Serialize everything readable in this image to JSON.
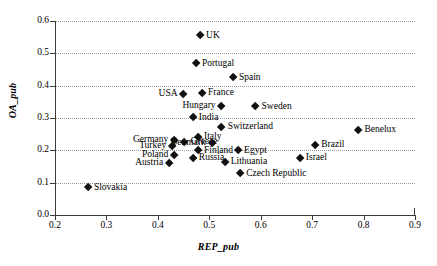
{
  "chart_data": {
    "type": "scatter",
    "title": "",
    "xlabel": "REP_pub",
    "ylabel": "OA_pub",
    "xlim": [
      0.2,
      0.9
    ],
    "ylim": [
      0.0,
      0.6
    ],
    "xticks": [
      "0.2",
      "0.3",
      "0.4",
      "0.5",
      "0.6",
      "0.7",
      "0.8",
      "0.9"
    ],
    "yticks": [
      "0.0",
      "0.1",
      "0.2",
      "0.3",
      "0.4",
      "0.5",
      "0.6"
    ],
    "grid": "horizontal-dotted",
    "legend": "none",
    "marker": "filled-diamond",
    "marker_color": "#111111",
    "points": [
      {
        "label": "UK",
        "x": 0.482,
        "y": 0.555,
        "label_side": "right"
      },
      {
        "label": "Portugal",
        "x": 0.474,
        "y": 0.468,
        "label_side": "right"
      },
      {
        "label": "Spain",
        "x": 0.546,
        "y": 0.425,
        "label_side": "right"
      },
      {
        "label": "France",
        "x": 0.486,
        "y": 0.377,
        "label_side": "right"
      },
      {
        "label": "USA",
        "x": 0.45,
        "y": 0.375,
        "label_side": "left"
      },
      {
        "label": "Hungary",
        "x": 0.524,
        "y": 0.337,
        "label_side": "left"
      },
      {
        "label": "Sweden",
        "x": 0.59,
        "y": 0.335,
        "label_side": "right"
      },
      {
        "label": "India",
        "x": 0.468,
        "y": 0.301,
        "label_side": "right"
      },
      {
        "label": "Switzerland",
        "x": 0.524,
        "y": 0.271,
        "label_side": "right"
      },
      {
        "label": "Benelux",
        "x": 0.79,
        "y": 0.262,
        "label_side": "right"
      },
      {
        "label": "Italy",
        "x": 0.478,
        "y": 0.241,
        "label_side": "right"
      },
      {
        "label": "Germany",
        "x": 0.432,
        "y": 0.232,
        "label_side": "left"
      },
      {
        "label": "Denmark",
        "x": 0.505,
        "y": 0.222,
        "label_side": "left"
      },
      {
        "label": "Greece",
        "x": 0.452,
        "y": 0.226,
        "label_side": "right"
      },
      {
        "label": "Turkey",
        "x": 0.428,
        "y": 0.214,
        "label_side": "left"
      },
      {
        "label": "Brazil",
        "x": 0.706,
        "y": 0.216,
        "label_side": "right"
      },
      {
        "label": "Finland",
        "x": 0.478,
        "y": 0.199,
        "label_side": "right"
      },
      {
        "label": "Egypt",
        "x": 0.556,
        "y": 0.199,
        "label_side": "right"
      },
      {
        "label": "Poland",
        "x": 0.432,
        "y": 0.186,
        "label_side": "left"
      },
      {
        "label": "Russia",
        "x": 0.468,
        "y": 0.177,
        "label_side": "right"
      },
      {
        "label": "Israel",
        "x": 0.676,
        "y": 0.176,
        "label_side": "right"
      },
      {
        "label": "Austria",
        "x": 0.422,
        "y": 0.16,
        "label_side": "left"
      },
      {
        "label": "Lithuania",
        "x": 0.53,
        "y": 0.163,
        "label_side": "right"
      },
      {
        "label": "Czech Republic",
        "x": 0.56,
        "y": 0.128,
        "label_side": "right"
      },
      {
        "label": "Slovakia",
        "x": 0.264,
        "y": 0.085,
        "label_side": "right"
      }
    ]
  }
}
